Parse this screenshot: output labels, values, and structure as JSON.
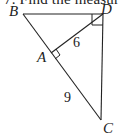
{
  "caption": "7. Find the measure",
  "figure": {
    "vertices": {
      "B": {
        "label": "B"
      },
      "D": {
        "label": "D"
      },
      "A": {
        "label": "A"
      },
      "C": {
        "label": "C"
      }
    },
    "segments": {
      "AD": {
        "label": "6"
      },
      "AC": {
        "label": "9"
      }
    },
    "right_angles": [
      "D",
      "A"
    ],
    "colors": {
      "stroke": "#222222",
      "background": "#ffffff"
    }
  }
}
